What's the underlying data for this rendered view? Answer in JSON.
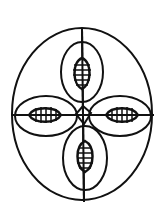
{
  "diagram": {
    "stroke_color": "#111111",
    "background": "#ffffff",
    "outer_ellipse": {
      "cx": 82,
      "cy": 114,
      "rx": 70,
      "ry": 86
    },
    "axes": {
      "vertical": {
        "x": 82,
        "y1": 28,
        "y2": 202
      },
      "horizontal": {
        "y": 115,
        "x1": 11,
        "x2": 153
      }
    },
    "lobes": [
      {
        "name": "top",
        "cx": 82,
        "cy": 72,
        "rx": 21,
        "ry": 30,
        "seed": {
          "cx": 82,
          "cy": 73,
          "rx": 9,
          "ry": 15,
          "hatch": "horizontal"
        }
      },
      {
        "name": "bottom",
        "cx": 84,
        "cy": 158,
        "rx": 22,
        "ry": 32,
        "seed": {
          "cx": 84,
          "cy": 156,
          "rx": 9,
          "ry": 16,
          "hatch": "horizontal"
        }
      },
      {
        "name": "left",
        "cx": 46,
        "cy": 116,
        "rx": 31,
        "ry": 20,
        "seed": {
          "cx": 45,
          "cy": 115,
          "rx": 16,
          "ry": 8,
          "hatch": "vertical"
        }
      },
      {
        "name": "right",
        "cx": 120,
        "cy": 116,
        "rx": 31,
        "ry": 20,
        "seed": {
          "cx": 122,
          "cy": 115,
          "rx": 16,
          "ry": 8,
          "hatch": "vertical"
        }
      }
    ],
    "center_diamond": {
      "cx": 83,
      "cy": 115,
      "size": 8
    }
  }
}
